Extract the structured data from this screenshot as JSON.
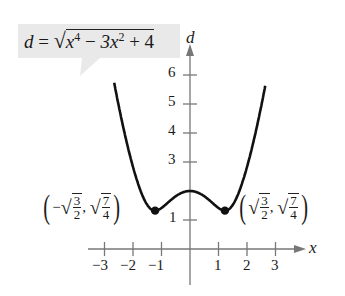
{
  "chart_data": {
    "type": "line",
    "equation_label": {
      "lhs": "d",
      "eq": "=",
      "radical": "√",
      "term1": "x",
      "exp1": "4",
      "op1": "−",
      "coef2": "3x",
      "exp2": "2",
      "op2": "+",
      "const": "4"
    },
    "xlabel": "x",
    "ylabel": "d",
    "xlim": [
      -3.2,
      3.4
    ],
    "ylim": [
      0,
      6.7
    ],
    "x_ticks": [
      -3,
      -2,
      -1,
      1,
      2,
      3
    ],
    "x_tick_labels": [
      "−3",
      "−2",
      "−1",
      "1",
      "2",
      "3"
    ],
    "y_ticks": [
      1,
      3,
      4,
      5,
      6
    ],
    "y_tick_labels": [
      "1",
      "3",
      "4",
      "5",
      "6"
    ],
    "grid": false,
    "series": [
      {
        "name": "d = sqrt(x^4 - 3x^2 + 4)",
        "x": [
          -2.65,
          -2.5,
          -2.25,
          -2.0,
          -1.75,
          -1.5,
          -1.2247,
          -1.0,
          -0.75,
          -0.5,
          -0.25,
          0,
          0.25,
          0.5,
          0.75,
          1.0,
          1.2247,
          1.5,
          1.75,
          2.0,
          2.25,
          2.5,
          2.65
        ],
        "y": [
          6.47,
          5.64,
          4.42,
          3.46,
          2.65,
          2.02,
          1.32,
          1.41,
          1.66,
          1.85,
          1.96,
          2.0,
          1.96,
          1.85,
          1.66,
          1.41,
          1.32,
          1.6,
          2.4,
          3.46,
          4.42,
          5.64,
          6.47
        ]
      }
    ],
    "points": [
      {
        "x": -1.2247,
        "y": 1.3229,
        "label": "(−√(3/2), √(7/4))"
      },
      {
        "x": 1.2247,
        "y": 1.3229,
        "label": "(√(3/2), √(7/4))"
      }
    ],
    "annotations": [
      {
        "text": "(−√(3/2), √(7/4))",
        "position": "left minimum"
      },
      {
        "text": "(√(3/2), √(7/4))",
        "position": "right minimum"
      }
    ]
  },
  "labels": {
    "left_point": {
      "open": "(",
      "neg": "−",
      "num1": "3",
      "den1": "2",
      "comma": ",",
      "num2": "7",
      "den2": "4",
      "close": ")"
    },
    "right_point": {
      "open": "(",
      "num1": "3",
      "den1": "2",
      "comma": ",",
      "num2": "7",
      "den2": "4",
      "close": ")"
    },
    "root": "√"
  },
  "colors": {
    "curve": "#111111",
    "axis": "#777777",
    "label_bg": "#e9e9e9",
    "text": "#1a1a1a"
  }
}
